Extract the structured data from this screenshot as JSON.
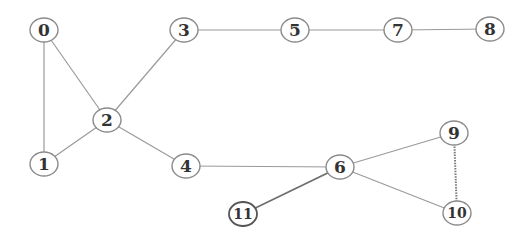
{
  "diagram": {
    "type": "undirected-graph",
    "nodes": [
      {
        "id": "0",
        "label": "0",
        "x": 44,
        "y": 30
      },
      {
        "id": "1",
        "label": "1",
        "x": 44,
        "y": 164
      },
      {
        "id": "2",
        "label": "2",
        "x": 107,
        "y": 120
      },
      {
        "id": "3",
        "label": "3",
        "x": 184,
        "y": 30
      },
      {
        "id": "4",
        "label": "4",
        "x": 186,
        "y": 166
      },
      {
        "id": "5",
        "label": "5",
        "x": 295,
        "y": 30
      },
      {
        "id": "6",
        "label": "6",
        "x": 340,
        "y": 167
      },
      {
        "id": "7",
        "label": "7",
        "x": 398,
        "y": 30
      },
      {
        "id": "8",
        "label": "8",
        "x": 490,
        "y": 29
      },
      {
        "id": "9",
        "label": "9",
        "x": 454,
        "y": 133
      },
      {
        "id": "10",
        "label": "10",
        "x": 457,
        "y": 213
      },
      {
        "id": "11",
        "label": "11",
        "x": 243,
        "y": 214
      }
    ],
    "edges": [
      {
        "from": "0",
        "to": "1",
        "style": "normal"
      },
      {
        "from": "0",
        "to": "2",
        "style": "normal"
      },
      {
        "from": "1",
        "to": "2",
        "style": "normal"
      },
      {
        "from": "2",
        "to": "3",
        "style": "normal"
      },
      {
        "from": "2",
        "to": "4",
        "style": "normal"
      },
      {
        "from": "3",
        "to": "5",
        "style": "normal"
      },
      {
        "from": "5",
        "to": "7",
        "style": "normal"
      },
      {
        "from": "7",
        "to": "8",
        "style": "normal"
      },
      {
        "from": "4",
        "to": "6",
        "style": "normal"
      },
      {
        "from": "6",
        "to": "11",
        "style": "dark"
      },
      {
        "from": "6",
        "to": "9",
        "style": "normal"
      },
      {
        "from": "6",
        "to": "10",
        "style": "normal"
      },
      {
        "from": "9",
        "to": "10",
        "style": "dotted"
      }
    ],
    "node_radius": 13,
    "colors": {
      "edge": "#9a9a9a",
      "node_stroke": "#8a8a8a",
      "label": "#333333",
      "background": "#ffffff"
    }
  }
}
